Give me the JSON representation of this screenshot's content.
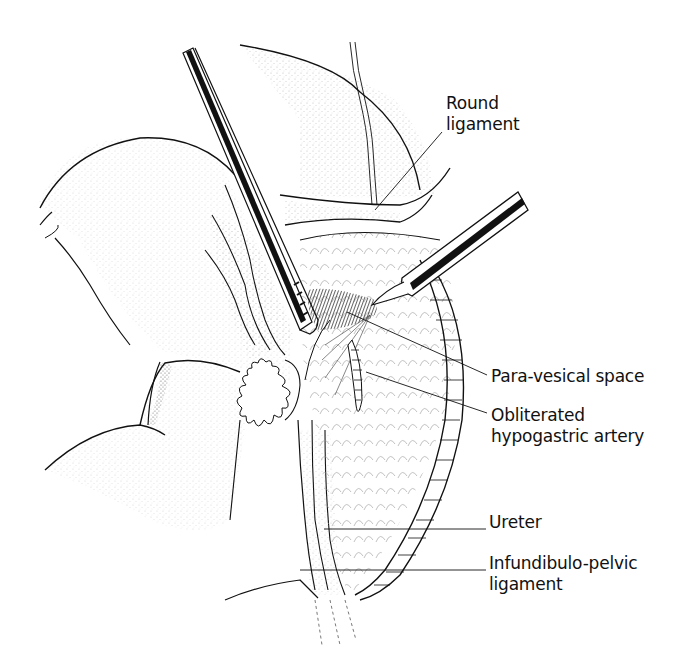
{
  "figure": {
    "stroke_color": "#111111",
    "stipple_color": "#8a8a8a",
    "instruments": [
      {
        "name": "left-grasper",
        "type": "ribbed grasping instrument"
      },
      {
        "name": "right-probe",
        "type": "dissecting probe"
      }
    ]
  },
  "labels": {
    "round_ligament": {
      "line1": "Round",
      "line2": "ligament"
    },
    "para_vesical_space": {
      "line1": "Para-vesical space"
    },
    "obliterated_hypogastric_artery": {
      "line1": "Obliterated",
      "line2": "hypogastric artery"
    },
    "ureter": {
      "line1": "Ureter"
    },
    "infundibulo_pelvic_ligament": {
      "line1": "Infundibulo-pelvic",
      "line2": "ligament"
    }
  }
}
